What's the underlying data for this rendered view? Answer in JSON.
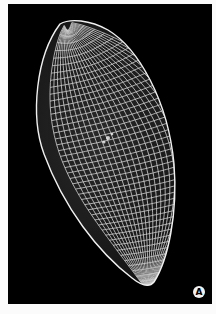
{
  "figure": {
    "background_color": "#000000",
    "mesh_color": "#e6e6e6",
    "panel_label": "A"
  },
  "caption": {
    "text": "",
    "note": "caption text clipped at bottom edge, illegible"
  }
}
